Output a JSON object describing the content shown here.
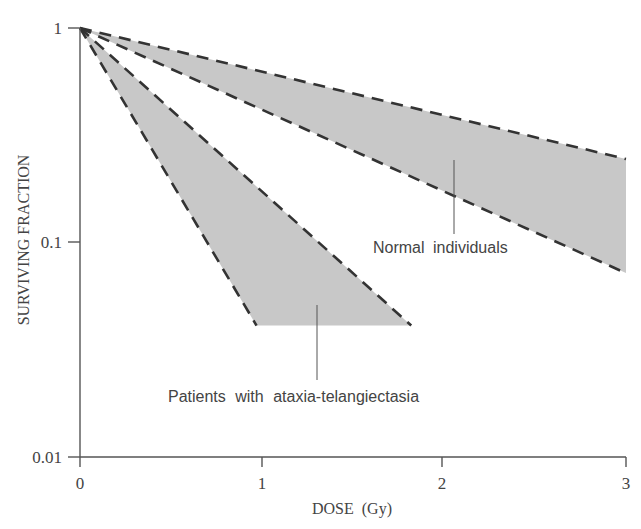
{
  "chart_data": {
    "type": "area",
    "title": "",
    "xlabel": "DOSE  (Gy)",
    "ylabel": "SURVIVING FRACTION",
    "xlim": [
      0,
      3
    ],
    "ylim": [
      0.01,
      1
    ],
    "yscale": "log",
    "x_ticks": [
      0,
      1,
      2,
      3
    ],
    "x_tick_labels": [
      "0",
      "1",
      "2",
      "3"
    ],
    "y_ticks": [
      0.01,
      0.1,
      1
    ],
    "y_tick_labels": [
      "0.01",
      "0.1",
      "1"
    ],
    "grid": false,
    "legend": "none (direct labels with leader lines)",
    "series": [
      {
        "name": "Normal individuals",
        "kind": "shaded band between dashed lines",
        "upper_edge": {
          "x": [
            0,
            3
          ],
          "y": [
            1,
            0.245
          ]
        },
        "lower_edge": {
          "x": [
            0,
            3
          ],
          "y": [
            1,
            0.072
          ]
        }
      },
      {
        "name": "Patients with ataxia-telangiectasia",
        "kind": "shaded band between dashed lines, truncated at SF=0.04",
        "upper_edge": {
          "x": [
            0,
            1.82
          ],
          "y": [
            1,
            0.041
          ]
        },
        "lower_edge": {
          "x": [
            0,
            0.97
          ],
          "y": [
            1,
            0.041
          ]
        },
        "bottom_cutoff": 0.041
      }
    ],
    "annotations": [
      {
        "text": "Normal individuals",
        "points_to": "normal band",
        "x": 2.06,
        "y": 0.1
      },
      {
        "text": "Patients with ataxia-telangiectasia",
        "points_to": "A-T band",
        "x": 1.3,
        "y": 0.018
      }
    ],
    "colors": {
      "band_fill": "#c8c8c8",
      "dash": "#333333",
      "axis": "#555555",
      "text": "#444444"
    }
  },
  "labels": {
    "x_axis": "DOSE  (Gy)",
    "y_axis": "SURVIVING FRACTION",
    "x_ticks": [
      "0",
      "1",
      "2",
      "3"
    ],
    "y_ticks": [
      "0.01",
      "0.1",
      "1"
    ],
    "normal": "Normal individuals",
    "at": "Patients with ataxia-telangiectasia"
  }
}
